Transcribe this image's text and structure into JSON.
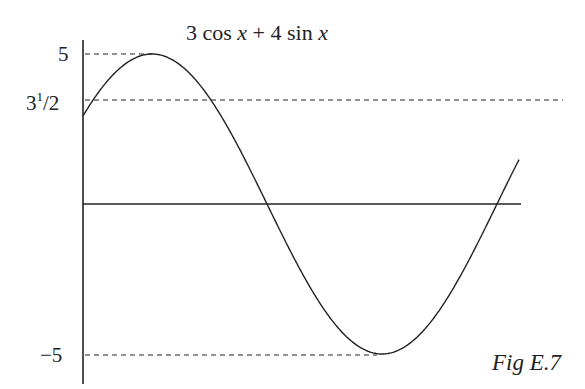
{
  "title": {
    "coef_a": "3",
    "fn_a": "cos",
    "var_a": "x",
    "op": "+",
    "coef_b": "4",
    "fn_b": "sin",
    "var_b": "x"
  },
  "caption": "Fig E.7",
  "labels": {
    "max": "5",
    "ref_base": "3",
    "ref_frac_num": "1",
    "ref_frac_sep": "/",
    "ref_frac_den": "2",
    "min": "−5"
  },
  "chart_data": {
    "type": "line",
    "title": "3 cos x + 4 sin x",
    "function": "y = 3cos(x) + 4sin(x)",
    "ylim": [
      -5,
      5
    ],
    "ytick_labels": [
      "5",
      "3¹/₂",
      "−5"
    ],
    "reference_lines": [
      {
        "y": 5,
        "style": "dashed",
        "label": "5"
      },
      {
        "y": 3.5,
        "style": "dashed",
        "label": "3¹/₂"
      },
      {
        "y": -5,
        "style": "dashed",
        "label": "−5"
      }
    ],
    "x_axis": {
      "y": 0,
      "style": "solid"
    },
    "key_points": [
      {
        "label": "start",
        "x": 0,
        "y": 3
      },
      {
        "label": "maximum",
        "y": 5
      },
      {
        "label": "zero crossing",
        "y": 0
      },
      {
        "label": "minimum",
        "y": -5
      },
      {
        "label": "zero crossing",
        "y": 0
      }
    ],
    "grid": false,
    "legend": null,
    "caption": "Fig E.7"
  }
}
